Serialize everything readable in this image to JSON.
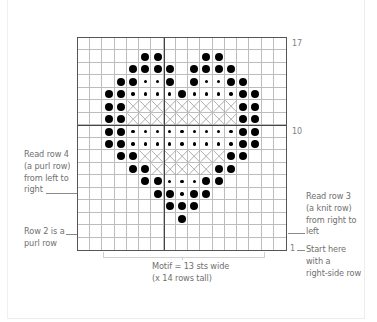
{
  "chart": {
    "columns": 17,
    "rows": 17,
    "row_labels": [
      {
        "row": 17,
        "text": "17"
      },
      {
        "row": 10,
        "text": "10"
      },
      {
        "row": 1,
        "text": "1"
      }
    ],
    "legend_symbols": {
      "B": "large-filled-dot",
      "s": "small-dot",
      "X": "cross",
      ".": "empty"
    },
    "pattern_top_to_bottom": [
      ".................",
      ".....BB...BB.....",
      "....BBBB.BBBB....",
      "...BBssB.BssBB...",
      "..BBssssBssssBB..",
      "..BBXXXXXXXXXBB..",
      "..BBXXXXXXXXXBB..",
      "..BBsssssssssBB..",
      "..BBsssssssssBB..",
      "...BBXXXXXXXBB...",
      "....BBXXXXXBB....",
      ".....BBsssBB.....",
      "......BBsBB......",
      ".......BBB.......",
      "........B........",
      ".................",
      "................."
    ]
  },
  "annotations": {
    "left_row4": [
      "Read row 4",
      "(a purl row)",
      "from left to",
      "right"
    ],
    "left_row2": [
      "Row 2 is a",
      "purl row"
    ],
    "right_row3": [
      "Read row 3",
      "(a knit row)",
      "from right to",
      "left"
    ],
    "right_row1": [
      "Start here",
      "with a",
      "right-side row"
    ],
    "motif_caption": [
      "Motif = 13 sts wide",
      "(x 14 rows tall)"
    ]
  }
}
